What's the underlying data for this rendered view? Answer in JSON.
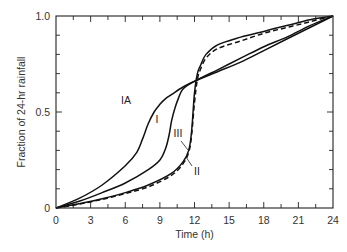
{
  "chart_data": {
    "type": "line",
    "title": "",
    "xlabel": "Time (h)",
    "ylabel": "Fraction of 24-hr rainfall",
    "xlim": [
      0,
      24
    ],
    "ylim": [
      0,
      1.0
    ],
    "x_ticks": [
      0,
      3,
      6,
      9,
      12,
      15,
      18,
      21,
      24
    ],
    "x_minor_step": 1.5,
    "y_ticks": [
      0,
      0.5,
      1.0
    ],
    "y_tick_labels": [
      "0",
      "0.5",
      "1.0"
    ],
    "y_minor_step": 0.1,
    "grid": false,
    "legend": "inline labels",
    "series": [
      {
        "name": "IA",
        "style": "solid",
        "x": [
          0,
          2,
          4,
          6,
          7,
          7.5,
          8,
          8.5,
          9,
          9.5,
          10,
          11,
          12,
          14,
          16,
          18,
          20,
          22,
          24
        ],
        "y": [
          0,
          0.05,
          0.12,
          0.22,
          0.29,
          0.36,
          0.44,
          0.5,
          0.54,
          0.57,
          0.59,
          0.63,
          0.66,
          0.71,
          0.76,
          0.82,
          0.88,
          0.94,
          1.0
        ]
      },
      {
        "name": "I",
        "style": "solid",
        "x": [
          0,
          2,
          4,
          6,
          8,
          9,
          9.5,
          9.8,
          10,
          10.3,
          10.6,
          11,
          12,
          14,
          16,
          18,
          20,
          22,
          24
        ],
        "y": [
          0,
          0.035,
          0.08,
          0.13,
          0.2,
          0.25,
          0.31,
          0.38,
          0.45,
          0.52,
          0.57,
          0.62,
          0.66,
          0.72,
          0.78,
          0.84,
          0.89,
          0.95,
          1.0
        ]
      },
      {
        "name": "II",
        "style": "solid",
        "x": [
          0,
          2,
          4,
          6,
          8,
          10,
          11,
          11.5,
          11.75,
          12,
          12.25,
          12.5,
          13,
          14,
          16,
          18,
          20,
          22,
          24
        ],
        "y": [
          0,
          0.022,
          0.048,
          0.08,
          0.12,
          0.18,
          0.24,
          0.3,
          0.4,
          0.6,
          0.7,
          0.74,
          0.8,
          0.85,
          0.89,
          0.92,
          0.95,
          0.98,
          1.0
        ]
      },
      {
        "name": "III",
        "style": "dashed",
        "x": [
          0,
          2,
          4,
          6,
          8,
          10,
          11,
          11.5,
          11.75,
          12,
          12.25,
          12.5,
          13,
          14,
          16,
          18,
          20,
          22,
          24
        ],
        "y": [
          0,
          0.02,
          0.045,
          0.075,
          0.11,
          0.17,
          0.23,
          0.29,
          0.38,
          0.55,
          0.67,
          0.72,
          0.78,
          0.83,
          0.87,
          0.91,
          0.94,
          0.97,
          1.0
        ]
      }
    ],
    "annotations": [
      {
        "text": "IA",
        "x": 7.3,
        "y": 0.44
      },
      {
        "text": "I",
        "x": 8.8,
        "y": 0.34
      },
      {
        "text": "III",
        "x": 10.4,
        "y": 0.37
      },
      {
        "text": "II",
        "x": 12.6,
        "y": 0.25
      }
    ]
  },
  "labels": {
    "xlabel": "Time (h)",
    "ylabel": "Fraction of 24-hr rainfall",
    "x_ticks": [
      "0",
      "3",
      "6",
      "9",
      "12",
      "15",
      "18",
      "21",
      "24"
    ],
    "y_ticks": [
      "0",
      "0.5",
      "1.0"
    ],
    "curves": [
      "IA",
      "I",
      "III",
      "II"
    ]
  }
}
